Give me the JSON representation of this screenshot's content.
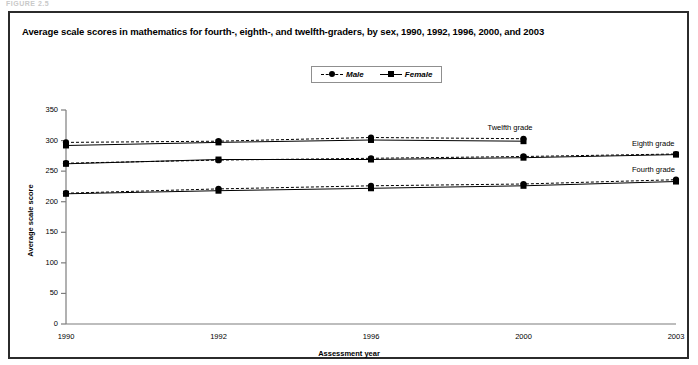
{
  "figure": {
    "caption": "FIGURE 2.5",
    "title": "Average scale scores in mathematics for fourth-, eighth-, and twelfth-graders, by sex, 1990, 1992, 1996, 2000, and 2003"
  },
  "legend": {
    "position": "top-center",
    "entries": [
      {
        "label": "Male",
        "marker": "circle",
        "line": "dashed",
        "color": "#000000"
      },
      {
        "label": "Female",
        "marker": "square",
        "line": "solid",
        "color": "#000000"
      }
    ]
  },
  "series_labels": [
    {
      "text": "Twelfth grade"
    },
    {
      "text": "Eighth grade"
    },
    {
      "text": "Fourth grade"
    }
  ],
  "chart_data": {
    "type": "line",
    "title": "Average scale scores in mathematics for fourth-, eighth-, and twelfth-graders, by sex, 1990, 1992, 1996, 2000, and 2003",
    "xlabel": "Assessment year",
    "ylabel": "Average scale score",
    "x": [
      1990,
      1992,
      1996,
      2000,
      2003
    ],
    "xtick_labels": [
      "1990",
      "1992",
      "1996",
      "2000",
      "2003"
    ],
    "ylim": [
      0,
      350
    ],
    "ytick_labels": [
      "0",
      "50",
      "100",
      "150",
      "200",
      "250",
      "300",
      "350"
    ],
    "yticks": [
      0,
      50,
      100,
      150,
      200,
      250,
      300,
      350
    ],
    "grid": false,
    "legend_position": "top-center",
    "series": [
      {
        "name": "Twelfth grade, Male",
        "grade": "Twelfth grade",
        "sex": "Male",
        "marker": "circle",
        "line": "dashed",
        "x": [
          1990,
          1992,
          1996,
          2000
        ],
        "values": [
          297,
          299,
          305,
          303
        ]
      },
      {
        "name": "Twelfth grade, Female",
        "grade": "Twelfth grade",
        "sex": "Female",
        "marker": "square",
        "line": "solid",
        "x": [
          1990,
          1992,
          1996,
          2000
        ],
        "values": [
          292,
          297,
          301,
          299
        ]
      },
      {
        "name": "Eighth grade, Male",
        "grade": "Eighth grade",
        "sex": "Male",
        "marker": "circle",
        "line": "dashed",
        "x": [
          1990,
          1992,
          1996,
          2000,
          2003
        ],
        "values": [
          263,
          268,
          271,
          274,
          278
        ]
      },
      {
        "name": "Eighth grade, Female",
        "grade": "Eighth grade",
        "sex": "Female",
        "marker": "square",
        "line": "solid",
        "x": [
          1990,
          1992,
          1996,
          2000,
          2003
        ],
        "values": [
          262,
          269,
          269,
          272,
          277
        ]
      },
      {
        "name": "Fourth grade, Male",
        "grade": "Fourth grade",
        "sex": "Male",
        "marker": "circle",
        "line": "dashed",
        "x": [
          1990,
          1992,
          1996,
          2000,
          2003
        ],
        "values": [
          214,
          221,
          226,
          229,
          236
        ]
      },
      {
        "name": "Fourth grade, Female",
        "grade": "Fourth grade",
        "sex": "Female",
        "marker": "square",
        "line": "solid",
        "x": [
          1990,
          1992,
          1996,
          2000,
          2003
        ],
        "values": [
          213,
          218,
          222,
          226,
          233
        ]
      }
    ]
  }
}
